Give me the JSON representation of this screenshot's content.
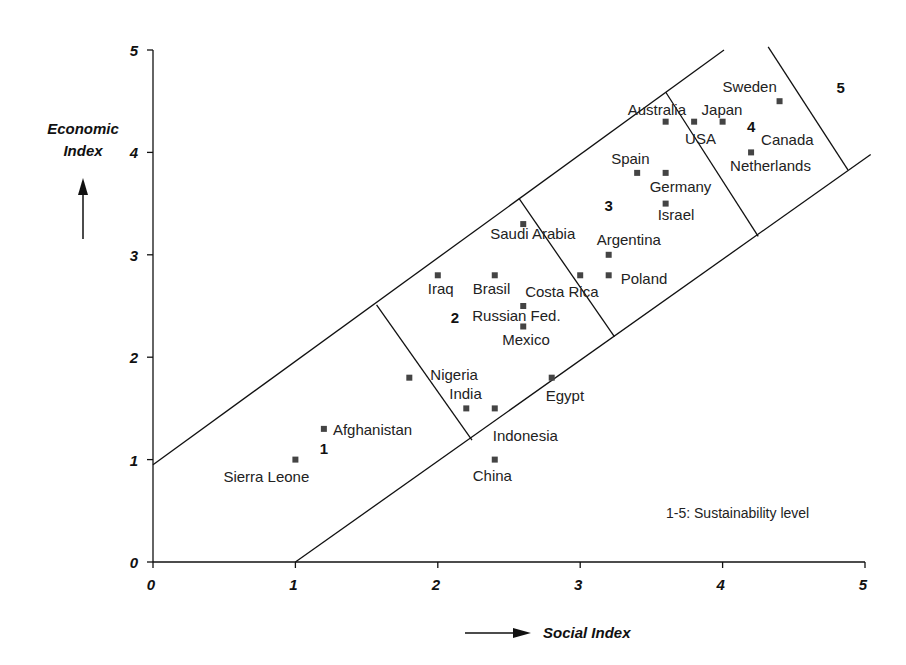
{
  "chart_data": {
    "type": "scatter",
    "title": "",
    "xlabel": "Social Index",
    "ylabel": "Economic Index",
    "xlim": [
      0,
      5
    ],
    "ylim": [
      0,
      5
    ],
    "x_ticks": [
      "0",
      "1",
      "2",
      "3",
      "4",
      "5"
    ],
    "y_ticks": [
      "0",
      "1",
      "2",
      "3",
      "4",
      "5"
    ],
    "grid": false,
    "legend_text": "1-5: Sustainability level",
    "points": [
      {
        "name": "Sierra Leone",
        "x": 1.0,
        "y": 1.0
      },
      {
        "name": "Afghanistan",
        "x": 1.2,
        "y": 1.3
      },
      {
        "name": "Nigeria",
        "x": 1.8,
        "y": 1.8
      },
      {
        "name": "India",
        "x": 2.2,
        "y": 1.5
      },
      {
        "name": "Indonesia",
        "x": 2.4,
        "y": 1.5
      },
      {
        "name": "China",
        "x": 2.4,
        "y": 1.0
      },
      {
        "name": "Egypt",
        "x": 2.8,
        "y": 1.8
      },
      {
        "name": "Iraq",
        "x": 2.0,
        "y": 2.8
      },
      {
        "name": "Brasil",
        "x": 2.4,
        "y": 2.8
      },
      {
        "name": "Saudi Arabia",
        "x": 2.6,
        "y": 3.3
      },
      {
        "name": "Russian Fed.",
        "x": 2.6,
        "y": 2.5
      },
      {
        "name": "Mexico",
        "x": 2.6,
        "y": 2.3
      },
      {
        "name": "Costa Rica",
        "x": 3.0,
        "y": 2.8
      },
      {
        "name": "Argentina",
        "x": 3.2,
        "y": 3.0
      },
      {
        "name": "Poland",
        "x": 3.2,
        "y": 2.8
      },
      {
        "name": "Spain",
        "x": 3.4,
        "y": 3.8
      },
      {
        "name": "Germany",
        "x": 3.6,
        "y": 3.8
      },
      {
        "name": "Israel",
        "x": 3.6,
        "y": 3.5
      },
      {
        "name": "Australia",
        "x": 3.6,
        "y": 4.3
      },
      {
        "name": "USA",
        "x": 3.8,
        "y": 4.3
      },
      {
        "name": "Japan",
        "x": 4.0,
        "y": 4.3
      },
      {
        "name": "Sweden",
        "x": 4.4,
        "y": 4.5
      },
      {
        "name": "Netherlands",
        "x": 4.2,
        "y": 4.0
      },
      {
        "name": "Canada",
        "x": 4.2,
        "y": 4.0
      }
    ],
    "zones": [
      {
        "level": "1",
        "x": 1.2,
        "y": 1.05
      },
      {
        "level": "2",
        "x": 2.12,
        "y": 2.33
      },
      {
        "level": "3",
        "x": 3.2,
        "y": 3.43
      },
      {
        "level": "4",
        "x": 4.2,
        "y": 4.2
      },
      {
        "level": "5",
        "x": 4.83,
        "y": 4.58
      }
    ],
    "band_lines": {
      "upper": {
        "from": [
          0,
          0.95
        ],
        "to": [
          4.01,
          5.0
        ]
      },
      "lower": {
        "from": [
          1.0,
          0
        ],
        "to": [
          5.04,
          3.98
        ]
      },
      "dividers": [
        {
          "from": [
            1.57,
            2.51
          ],
          "to": [
            2.24,
            1.19
          ]
        },
        {
          "from": [
            2.57,
            3.55
          ],
          "to": [
            3.24,
            2.2
          ]
        },
        {
          "from": [
            3.6,
            4.59
          ],
          "to": [
            4.25,
            3.18
          ]
        },
        {
          "from": [
            4.32,
            5.03
          ],
          "to": [
            4.88,
            3.83
          ]
        }
      ]
    }
  },
  "axes": {
    "x_title": "Social Index",
    "y_title_line1": "Economic",
    "y_title_line2": "Index"
  },
  "label_positions": {
    "Sierra Leone": {
      "dx": -72,
      "dy": 22
    },
    "Afghanistan": {
      "dx": 9,
      "dy": 6
    },
    "Nigeria": {
      "dx": 21,
      "dy": 2
    },
    "India": {
      "dx": -17,
      "dy": -9
    },
    "Indonesia": {
      "dx": -2,
      "dy": 33
    },
    "China": {
      "dx": -22,
      "dy": 21
    },
    "Egypt": {
      "dx": -6,
      "dy": 23
    },
    "Iraq": {
      "dx": -10,
      "dy": 19
    },
    "Brasil": {
      "dx": -22,
      "dy": 19
    },
    "Saudi Arabia": {
      "dx": -33,
      "dy": 15
    },
    "Russian Fed.": {
      "dx": -51,
      "dy": 15
    },
    "Mexico": {
      "dx": -21,
      "dy": 19
    },
    "Costa Rica": {
      "dx": -55,
      "dy": 22
    },
    "Argentina": {
      "dx": -12,
      "dy": -10
    },
    "Poland": {
      "dx": 12,
      "dy": 9
    },
    "Spain": {
      "dx": -26,
      "dy": -9
    },
    "Germany": {
      "dx": -16,
      "dy": 19
    },
    "Israel": {
      "dx": -8,
      "dy": 16
    },
    "Australia": {
      "dx": -38,
      "dy": -7
    },
    "USA": {
      "dx": -9,
      "dy": 22
    },
    "Japan": {
      "dx": -21,
      "dy": -7
    },
    "Sweden": {
      "dx": -57,
      "dy": -9
    },
    "Netherlands": {
      "dx": -21,
      "dy": 19
    },
    "Canada": {
      "dx": 10,
      "dy": -7
    }
  }
}
